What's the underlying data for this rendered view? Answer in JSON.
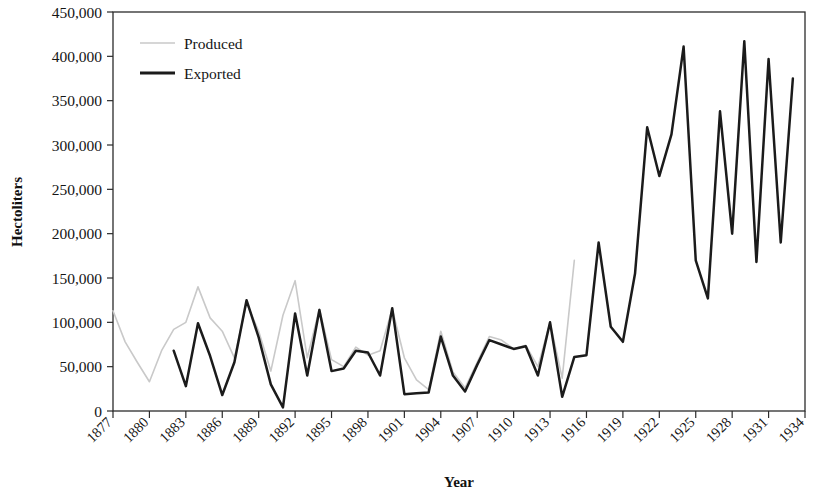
{
  "chart_data": {
    "type": "line",
    "title": "",
    "subtitle": "",
    "xlabel": "Year",
    "ylabel": "Hectoliters",
    "xlim": [
      1877,
      1934
    ],
    "ylim": [
      0,
      450000
    ],
    "grid": false,
    "legend_position": "top-left",
    "ytick_labels": [
      "0",
      "50,000",
      "100,000",
      "150,000",
      "200,000",
      "250,000",
      "300,000",
      "350,000",
      "400,000",
      "450,000"
    ],
    "ytick_values": [
      0,
      50000,
      100000,
      150000,
      200000,
      250000,
      300000,
      350000,
      400000,
      450000
    ],
    "xtick_labels": [
      "1877",
      "1880",
      "1883",
      "1886",
      "1889",
      "1892",
      "1895",
      "1898",
      "1901",
      "1904",
      "1907",
      "1910",
      "1913",
      "1916",
      "1919",
      "1922",
      "1925",
      "1928",
      "1931",
      "1934"
    ],
    "xtick_values": [
      1877,
      1880,
      1883,
      1886,
      1889,
      1892,
      1895,
      1898,
      1901,
      1904,
      1907,
      1910,
      1913,
      1916,
      1919,
      1922,
      1925,
      1928,
      1931,
      1934
    ],
    "x": [
      1877,
      1878,
      1879,
      1880,
      1881,
      1882,
      1883,
      1884,
      1885,
      1886,
      1887,
      1888,
      1889,
      1890,
      1891,
      1892,
      1893,
      1894,
      1895,
      1896,
      1897,
      1898,
      1899,
      1900,
      1901,
      1902,
      1903,
      1904,
      1905,
      1906,
      1907,
      1908,
      1909,
      1910,
      1911,
      1912,
      1913,
      1914,
      1915,
      1916,
      1917,
      1918,
      1919,
      1920,
      1921,
      1922,
      1923,
      1924,
      1925,
      1926,
      1927,
      1928,
      1929,
      1930,
      1931,
      1932,
      1933,
      1934
    ],
    "series": [
      {
        "name": "Produced",
        "color": "#c9c9c9",
        "style": "thin-gray",
        "values": [
          113000,
          78000,
          55000,
          33000,
          68000,
          92000,
          100000,
          140000,
          105000,
          90000,
          60000,
          122000,
          90000,
          45000,
          108000,
          147000,
          60000,
          115000,
          58000,
          50000,
          72000,
          63000,
          68000,
          115000,
          60000,
          35000,
          24000,
          90000,
          44000,
          26000,
          55000,
          84000,
          80000,
          70000,
          74000,
          50000,
          100000,
          37000,
          170000,
          null,
          null,
          null,
          null,
          null,
          null,
          null,
          null,
          null,
          null,
          null,
          null,
          null,
          null,
          null,
          null,
          null,
          null,
          null
        ]
      },
      {
        "name": "Exported",
        "color": "#1b1b1b",
        "style": "thick-black",
        "values": [
          null,
          null,
          null,
          null,
          null,
          68000,
          28000,
          99000,
          62000,
          18000,
          55000,
          125000,
          83000,
          30000,
          4000,
          110000,
          40000,
          114000,
          45000,
          48000,
          68000,
          66000,
          40000,
          116000,
          19000,
          20000,
          21000,
          84000,
          40000,
          22000,
          52000,
          80000,
          75000,
          70000,
          73000,
          40000,
          100000,
          16000,
          61000,
          63000,
          190000,
          95000,
          78000,
          155000,
          320000,
          265000,
          312000,
          411000,
          170000,
          127000,
          338000,
          200000,
          417000,
          168000,
          397000,
          190000,
          375000,
          null
        ]
      }
    ]
  },
  "legend": {
    "entries": [
      {
        "label": "Produced"
      },
      {
        "label": "Exported"
      }
    ]
  },
  "axes": {
    "y_title": "Hectoliters",
    "x_title": "Year"
  }
}
